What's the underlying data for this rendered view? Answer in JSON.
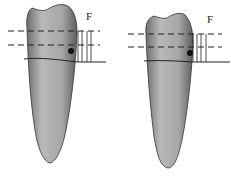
{
  "figure": {
    "panels": [
      {
        "id": "left",
        "force_label": "F",
        "description": "Tooth with dashed reference lines and marked point"
      },
      {
        "id": "right",
        "force_label": "F",
        "description": "Tooth with dashed reference lines and marked point"
      }
    ]
  },
  "colors": {
    "tooth_fill": "#a9a9a9",
    "tooth_edge": "#333333",
    "lines": "#222222"
  }
}
